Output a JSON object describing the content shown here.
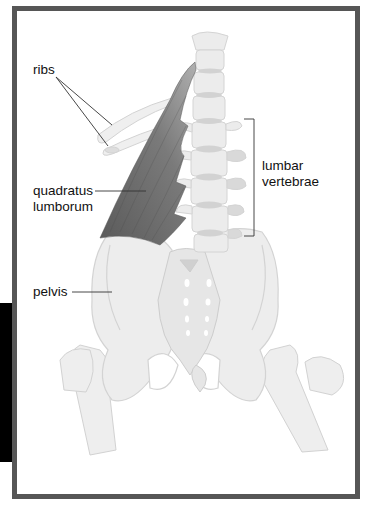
{
  "figure": {
    "labels": {
      "ribs": "ribs",
      "quadratus_line1": "quadratus",
      "quadratus_line2": "lumborum",
      "lumbar_line1": "lumbar",
      "lumbar_line2": "vertebrae",
      "pelvis": "pelvis"
    },
    "colors": {
      "frame_border": "#565656",
      "bone_fill": "#ededed",
      "bone_stroke": "#d0d0d0",
      "muscle": "#6e6e6e",
      "disc": "#cfcfcf",
      "leader_line": "#333333",
      "side_tab": "#000000"
    }
  }
}
